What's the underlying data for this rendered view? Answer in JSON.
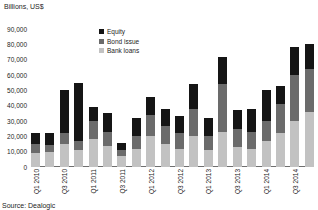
{
  "chart_data": {
    "type": "bar",
    "title": "Billions, US$",
    "stacked": true,
    "xlabel": "",
    "ylabel": "Billions, US$",
    "ylim": [
      0,
      90000
    ],
    "ytick_labels": [
      "90,000",
      "80,000",
      "70,000",
      "60,000",
      "50,000",
      "40,000",
      "30,000",
      "20,000",
      "10,000",
      "0"
    ],
    "ytick_values": [
      90000,
      80000,
      70000,
      60000,
      50000,
      40000,
      30000,
      20000,
      10000,
      0
    ],
    "grid": false,
    "legend_position": "top-center",
    "categories": [
      "Q1 2010",
      "Q2 2010",
      "Q3 2010",
      "Q4 2010",
      "Q1 2011",
      "Q2 2011",
      "Q3 2011",
      "Q4 2011",
      "Q1 2012",
      "Q2 2012",
      "Q3 2012",
      "Q4 2012",
      "Q1 2013",
      "Q2 2013",
      "Q3 2013",
      "Q4 2013",
      "Q1 2014",
      "Q2 2014",
      "Q3 2014",
      "Q4 2014"
    ],
    "tick_labels_shown": [
      "Q1 2010",
      "Q3 2010",
      "Q1 2011",
      "Q3 2011",
      "Q1 2012",
      "Q3 2012",
      "Q1 2013",
      "Q3 2013",
      "Q1 2014",
      "Q3 2014"
    ],
    "series": [
      {
        "name": "Bank loans",
        "color": "#c2c2c2",
        "values": [
          9000,
          9500,
          15000,
          11000,
          18000,
          14000,
          7000,
          12000,
          20000,
          15000,
          12000,
          20000,
          11000,
          23000,
          13000,
          12000,
          17000,
          22000,
          30000,
          36000
        ]
      },
      {
        "name": "Bond issue",
        "color": "#6b6b6b",
        "values": [
          6000,
          5000,
          7000,
          6000,
          12000,
          9000,
          4000,
          8000,
          14000,
          12000,
          10000,
          18000,
          9000,
          31000,
          12000,
          11000,
          13000,
          19000,
          30000,
          28000
        ]
      },
      {
        "name": "Equity",
        "color": "#151515",
        "values": [
          7000,
          7500,
          28000,
          38000,
          9000,
          12000,
          5000,
          12000,
          12000,
          11000,
          11000,
          16000,
          12000,
          18000,
          12000,
          15000,
          20000,
          12000,
          18000,
          16000
        ]
      }
    ],
    "totals": [
      22000,
      22000,
      50000,
      55000,
      39000,
      35000,
      16000,
      32000,
      46000,
      38000,
      33000,
      54000,
      32000,
      72000,
      37000,
      38000,
      50000,
      53000,
      78000,
      80000
    ]
  },
  "legend": {
    "items": [
      {
        "label": "Equity",
        "color": "#151515"
      },
      {
        "label": "Bond issue",
        "color": "#6b6b6b"
      },
      {
        "label": "Bank loans",
        "color": "#c2c2c2"
      }
    ]
  },
  "source": {
    "text": "Source: Dealogic"
  }
}
